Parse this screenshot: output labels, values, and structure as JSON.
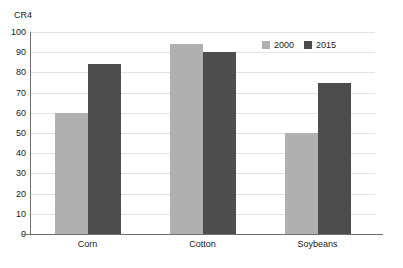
{
  "chart_data": {
    "type": "bar",
    "title": "",
    "subtitle": "",
    "xlabel": "",
    "ylabel": "CR4",
    "ylim": [
      0,
      100
    ],
    "yticks": [
      0,
      10,
      20,
      30,
      40,
      50,
      60,
      70,
      80,
      90,
      100
    ],
    "ytick_labels": [
      "0",
      "10",
      "20",
      "30",
      "40",
      "50",
      "60",
      "70",
      "80",
      "90",
      "100"
    ],
    "grid": true,
    "grid_axis": "y",
    "legend_position": "top-right-inside",
    "categories": [
      "Corn",
      "Cotton",
      "Soybeans"
    ],
    "series": [
      {
        "name": "2000",
        "color": "#b0b0b0",
        "values": [
          60,
          94,
          50
        ]
      },
      {
        "name": "2015",
        "color": "#4d4d4d",
        "values": [
          84,
          90,
          75
        ]
      }
    ]
  },
  "legend": {
    "entries": [
      {
        "label": "2000",
        "swatch": "legend-swatch-2000"
      },
      {
        "label": "2015",
        "swatch": "legend-swatch-2015"
      }
    ]
  },
  "colors": {
    "series_2000": "#b0b0b0",
    "series_2015": "#4d4d4d",
    "gridline": "#e3e3e3",
    "axis": "#6f6f6f",
    "background": "#ffffff",
    "text": "#1a1a1a"
  }
}
